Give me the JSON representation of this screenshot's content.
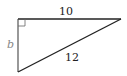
{
  "diagram": {
    "type": "right-triangle",
    "vertices": {
      "right_angle": {
        "x": 18,
        "y": 19
      },
      "top_right": {
        "x": 121,
        "y": 19
      },
      "bottom_left": {
        "x": 18,
        "y": 72
      }
    },
    "labels": {
      "top_side": "10",
      "left_side": "b",
      "hypotenuse": "12"
    },
    "colors": {
      "stroke": "#222222",
      "variable_label": "#888888",
      "background": "#ffffff"
    }
  }
}
